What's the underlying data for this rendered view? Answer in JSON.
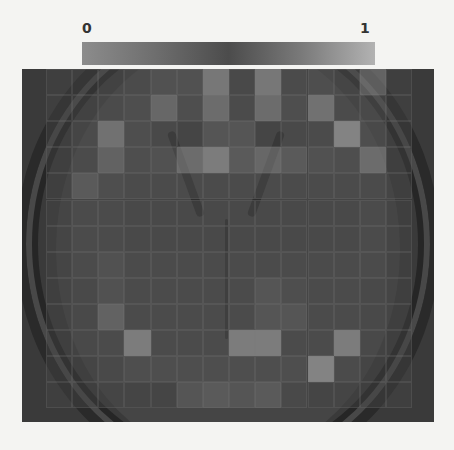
{
  "colorbar": {
    "min_label": "0",
    "max_label": "1",
    "colors": [
      "#8c8c8c",
      "#6e6e6e",
      "#4c4c4c",
      "#7a7a7a",
      "#b2b2b2"
    ]
  },
  "heatmap": {
    "description": "Saliency heatmap grid overlaid on axial brain MRI slice",
    "rows": 13,
    "cols": 14,
    "values": [
      [
        0.15,
        0.15,
        0.2,
        0.25,
        0.35,
        0.35,
        0.75,
        0.2,
        0.75,
        0.25,
        0.3,
        0.25,
        0.6,
        0.15
      ],
      [
        0.15,
        0.2,
        0.25,
        0.3,
        0.6,
        0.3,
        0.65,
        0.25,
        0.65,
        0.3,
        0.7,
        0.25,
        0.3,
        0.15
      ],
      [
        0.15,
        0.25,
        0.7,
        0.3,
        0.2,
        0.15,
        0.4,
        0.4,
        0.15,
        0.2,
        0.25,
        0.85,
        0.3,
        0.15
      ],
      [
        0.15,
        0.25,
        0.55,
        0.3,
        0.35,
        0.65,
        0.8,
        0.45,
        0.6,
        0.45,
        0.35,
        0.3,
        0.65,
        0.15
      ],
      [
        0.15,
        0.45,
        0.3,
        0.25,
        0.25,
        0.25,
        0.25,
        0.25,
        0.25,
        0.25,
        0.25,
        0.25,
        0.25,
        0.15
      ],
      [
        0.15,
        0.25,
        0.25,
        0.2,
        0.2,
        0.2,
        0.2,
        0.2,
        0.2,
        0.2,
        0.2,
        0.2,
        0.25,
        0.15
      ],
      [
        0.15,
        0.25,
        0.25,
        0.2,
        0.2,
        0.2,
        0.2,
        0.2,
        0.2,
        0.2,
        0.2,
        0.2,
        0.25,
        0.15
      ],
      [
        0.15,
        0.25,
        0.35,
        0.25,
        0.25,
        0.25,
        0.25,
        0.25,
        0.25,
        0.25,
        0.25,
        0.25,
        0.25,
        0.15
      ],
      [
        0.15,
        0.2,
        0.35,
        0.25,
        0.25,
        0.25,
        0.25,
        0.25,
        0.4,
        0.3,
        0.25,
        0.25,
        0.2,
        0.15
      ],
      [
        0.15,
        0.2,
        0.55,
        0.25,
        0.25,
        0.25,
        0.25,
        0.25,
        0.4,
        0.4,
        0.25,
        0.25,
        0.2,
        0.15
      ],
      [
        0.15,
        0.2,
        0.25,
        0.8,
        0.25,
        0.25,
        0.25,
        0.8,
        0.8,
        0.25,
        0.25,
        0.8,
        0.2,
        0.15
      ],
      [
        0.15,
        0.15,
        0.2,
        0.3,
        0.3,
        0.3,
        0.3,
        0.3,
        0.3,
        0.3,
        0.85,
        0.25,
        0.15,
        0.15
      ],
      [
        0.15,
        0.15,
        0.15,
        0.15,
        0.15,
        0.4,
        0.45,
        0.4,
        0.45,
        0.2,
        0.15,
        0.15,
        0.15,
        0.15
      ]
    ]
  }
}
